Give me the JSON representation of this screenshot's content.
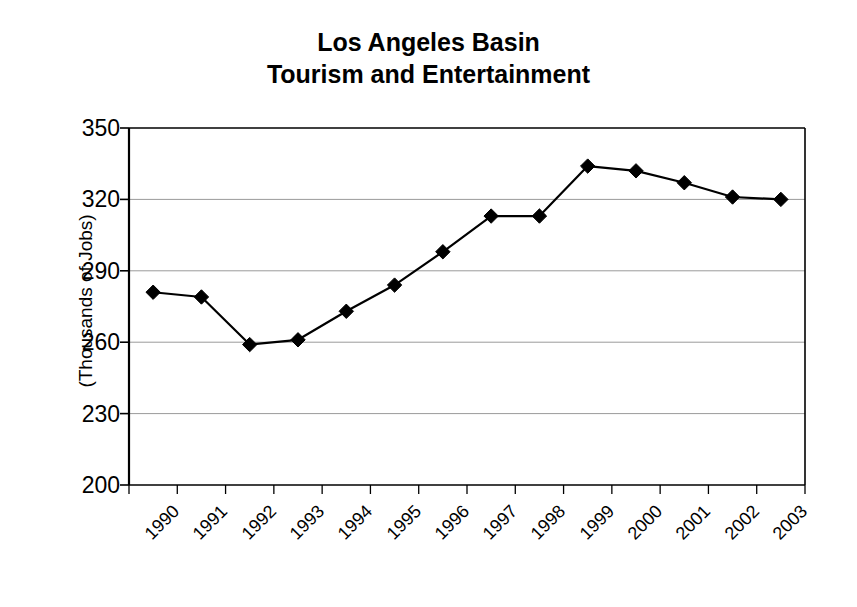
{
  "chart_data": {
    "type": "line",
    "title": "Los Angeles Basin Tourism and Entertainment",
    "title_lines": [
      "Los Angeles Basin",
      "Tourism and Entertainment"
    ],
    "xlabel": "",
    "ylabel": "(Thousands of Jobs)",
    "categories": [
      "1990",
      "1991",
      "1992",
      "1993",
      "1994",
      "1995",
      "1996",
      "1997",
      "1998",
      "1999",
      "2000",
      "2001",
      "2002",
      "2003"
    ],
    "values": [
      281,
      279,
      259,
      261,
      273,
      284,
      298,
      313,
      313,
      334,
      332,
      327,
      321,
      320
    ],
    "ylim": [
      200,
      350
    ],
    "yticks": [
      350,
      320,
      290,
      260,
      230,
      200
    ],
    "ytick_labels": [
      "350",
      "320",
      "290",
      "260",
      "230",
      "200"
    ],
    "grid": true,
    "grid_axis": "y",
    "legend": false,
    "series": [
      {
        "name": "Tourism and Entertainment Jobs",
        "values": [
          281,
          279,
          259,
          261,
          273,
          284,
          298,
          313,
          313,
          334,
          332,
          327,
          321,
          320
        ],
        "marker": "diamond",
        "line_color": "#000000",
        "marker_color": "#000000"
      }
    ]
  },
  "style": {
    "background": "#ffffff",
    "axis_color": "#000000",
    "grid_color": "#9a9a9a",
    "text_color": "#000000"
  }
}
